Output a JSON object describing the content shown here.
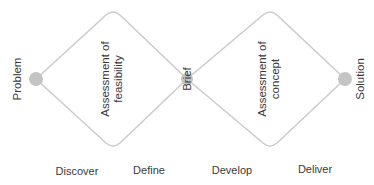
{
  "diagram": {
    "nodes": {
      "start": "Problem",
      "middle": "Brief",
      "end": "Solution"
    },
    "diamonds": [
      {
        "label_line1": "Assessment of",
        "label_line2": "feasibility"
      },
      {
        "label_line1": "Assessment of",
        "label_line2": "concept"
      }
    ],
    "phases": [
      "Discover",
      "Define",
      "Develop",
      "Deliver"
    ],
    "colors": {
      "line": "#cccccc",
      "node": "#c4c4c4",
      "text": "#3a3a3a"
    }
  }
}
